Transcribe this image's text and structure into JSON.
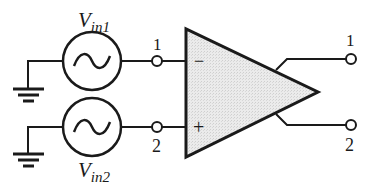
{
  "diagram": {
    "type": "differential-amplifier-circuit",
    "sources": [
      {
        "id": "vin1",
        "label_main": "V",
        "label_sub": "in1",
        "symbol": "ac-sine-source-icon"
      },
      {
        "id": "vin2",
        "label_main": "V",
        "label_sub": "in2",
        "symbol": "ac-sine-source-icon"
      }
    ],
    "amplifier": {
      "inverting_sign": "−",
      "noninverting_sign": "+",
      "fill_color": "#e6e6e6"
    },
    "input_terminals": [
      {
        "label": "1"
      },
      {
        "label": "2"
      }
    ],
    "output_terminals": [
      {
        "label": "1"
      },
      {
        "label": "2"
      }
    ],
    "line_color": "#1a1a1a"
  }
}
